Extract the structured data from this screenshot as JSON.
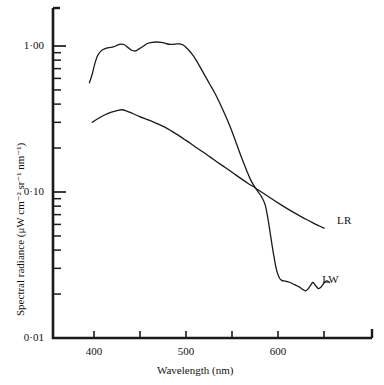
{
  "figure": {
    "background": "#ffffff",
    "ink_color": "#1a1a1a"
  },
  "axes": {
    "y_title": "Spectral radiance (μW cm⁻² sr⁻¹ nm⁻¹)",
    "x_title": "Wavelength (nm)",
    "y_tick_labels": [
      "1·00",
      "0·10",
      "0·01"
    ],
    "x_tick_labels": [
      "400",
      "500",
      "600"
    ]
  },
  "annotations": {
    "curve_label_lr": "LR",
    "curve_label_lw": "LW"
  },
  "chart_data": {
    "type": "line",
    "title": "",
    "xlabel": "Wavelength (nm)",
    "ylabel": "Spectral radiance (μW cm⁻² sr⁻¹ nm⁻¹)",
    "xlim": [
      370,
      690
    ],
    "ylim": [
      0.01,
      2.0
    ],
    "yscale": "log",
    "xscale": "linear",
    "grid": false,
    "legend": "inline-labels",
    "x_ticks_major": [
      400,
      500,
      600
    ],
    "x_ticks_minor": [
      450,
      550,
      650
    ],
    "y_ticks_major": [
      1.0,
      0.1,
      0.01
    ],
    "y_ticks_minor": [
      0.9,
      0.8,
      0.7,
      0.6,
      0.5,
      0.4,
      0.3,
      0.2,
      0.09,
      0.08,
      0.07,
      0.06,
      0.05,
      0.04,
      0.03,
      0.02
    ],
    "series": [
      {
        "name": "LW",
        "label": "LW",
        "label_position": {
          "x": 648,
          "y": 0.0245
        },
        "points": [
          [
            395,
            0.56
          ],
          [
            398,
            0.64
          ],
          [
            401,
            0.76
          ],
          [
            404,
            0.86
          ],
          [
            408,
            0.93
          ],
          [
            412,
            0.96
          ],
          [
            416,
            0.975
          ],
          [
            421,
            0.985
          ],
          [
            425,
            1.01
          ],
          [
            429,
            1.03
          ],
          [
            433,
            1.02
          ],
          [
            437,
            0.975
          ],
          [
            441,
            0.935
          ],
          [
            445,
            0.925
          ],
          [
            449,
            0.955
          ],
          [
            454,
            1.0
          ],
          [
            458,
            1.04
          ],
          [
            463,
            1.06
          ],
          [
            468,
            1.065
          ],
          [
            473,
            1.06
          ],
          [
            478,
            1.04
          ],
          [
            483,
            1.025
          ],
          [
            488,
            1.03
          ],
          [
            493,
            1.035
          ],
          [
            497,
            1.015
          ],
          [
            501,
            0.965
          ],
          [
            506,
            0.89
          ],
          [
            511,
            0.8
          ],
          [
            516,
            0.705
          ],
          [
            521,
            0.62
          ],
          [
            526,
            0.545
          ],
          [
            531,
            0.48
          ],
          [
            536,
            0.415
          ],
          [
            541,
            0.355
          ],
          [
            546,
            0.3
          ],
          [
            551,
            0.25
          ],
          [
            556,
            0.205
          ],
          [
            561,
            0.168
          ],
          [
            566,
            0.14
          ],
          [
            570,
            0.122
          ],
          [
            574,
            0.11
          ],
          [
            578,
            0.101
          ],
          [
            582,
            0.093
          ],
          [
            586,
            0.082
          ],
          [
            589,
            0.066
          ],
          [
            592,
            0.05
          ],
          [
            595,
            0.038
          ],
          [
            598,
            0.03
          ],
          [
            601,
            0.0262
          ],
          [
            604,
            0.0248
          ],
          [
            608,
            0.0245
          ],
          [
            613,
            0.024
          ],
          [
            618,
            0.0232
          ],
          [
            623,
            0.0224
          ],
          [
            627,
            0.0215
          ],
          [
            630,
            0.021
          ],
          [
            633,
            0.0218
          ],
          [
            636,
            0.0232
          ],
          [
            638,
            0.024
          ],
          [
            641,
            0.0228
          ],
          [
            644,
            0.0218
          ],
          [
            647,
            0.0224
          ],
          [
            650,
            0.0238
          ],
          [
            653,
            0.0246
          ],
          [
            656,
            0.024
          ]
        ]
      },
      {
        "name": "LR",
        "label": "LR",
        "label_position": {
          "x": 664,
          "y": 0.0625
        },
        "points": [
          [
            398,
            0.3
          ],
          [
            405,
            0.32
          ],
          [
            412,
            0.338
          ],
          [
            419,
            0.352
          ],
          [
            426,
            0.362
          ],
          [
            430,
            0.366
          ],
          [
            435,
            0.36
          ],
          [
            442,
            0.345
          ],
          [
            449,
            0.33
          ],
          [
            456,
            0.317
          ],
          [
            463,
            0.305
          ],
          [
            470,
            0.292
          ],
          [
            477,
            0.278
          ],
          [
            484,
            0.262
          ],
          [
            491,
            0.246
          ],
          [
            498,
            0.23
          ],
          [
            505,
            0.215
          ],
          [
            512,
            0.2
          ],
          [
            519,
            0.187
          ],
          [
            526,
            0.174
          ],
          [
            533,
            0.162
          ],
          [
            540,
            0.151
          ],
          [
            547,
            0.141
          ],
          [
            554,
            0.131
          ],
          [
            561,
            0.122
          ],
          [
            568,
            0.114
          ],
          [
            575,
            0.107
          ],
          [
            582,
            0.1
          ],
          [
            589,
            0.0935
          ],
          [
            596,
            0.0875
          ],
          [
            603,
            0.082
          ],
          [
            610,
            0.077
          ],
          [
            617,
            0.0725
          ],
          [
            624,
            0.0685
          ],
          [
            631,
            0.0648
          ],
          [
            638,
            0.0615
          ],
          [
            645,
            0.0585
          ],
          [
            650,
            0.0565
          ]
        ]
      }
    ]
  }
}
